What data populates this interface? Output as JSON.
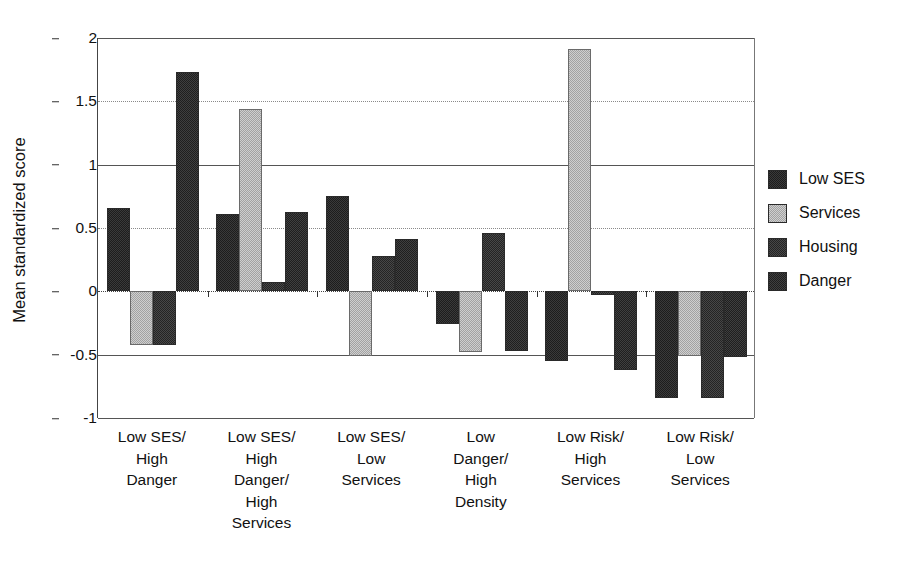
{
  "chart_data": {
    "type": "bar",
    "title": "",
    "xlabel": "",
    "ylabel": "Mean standardized score",
    "ylim": [
      -1,
      2
    ],
    "yticks": [
      "2",
      "1.5",
      "1",
      "0.5",
      "0",
      "-0.5",
      "-1"
    ],
    "ytick_values": [
      2,
      1.5,
      1,
      0.5,
      0,
      -0.5,
      -1
    ],
    "grid": true,
    "legend_position": "right",
    "categories": [
      "Low SES/ High Danger",
      "Low SES/ High Danger/ High Services",
      "Low SES/ Low Services",
      "Low Danger/ High Density",
      "Low Risk/ High Services",
      "Low Risk/ Low Services"
    ],
    "category_lines": [
      [
        "Low SES/",
        "High",
        "Danger"
      ],
      [
        "Low SES/",
        "High",
        "Danger/",
        "High",
        "Services"
      ],
      [
        "Low SES/",
        "Low",
        "Services"
      ],
      [
        "Low",
        "Danger/",
        "High",
        "Density"
      ],
      [
        "Low Risk/",
        "High",
        "Services"
      ],
      [
        "Low Risk/",
        "Low",
        "Services"
      ]
    ],
    "series": [
      {
        "name": "Low SES",
        "color": "#1d1d1d",
        "values": [
          0.66,
          0.61,
          0.75,
          -0.26,
          -0.55,
          -0.84
        ]
      },
      {
        "name": "Services",
        "color": "#cfcfcf",
        "values": [
          -0.42,
          1.44,
          -0.51,
          -0.48,
          1.91,
          -0.51
        ]
      },
      {
        "name": "Housing",
        "color": "#242424",
        "values": [
          -0.42,
          0.07,
          0.28,
          0.46,
          -0.03,
          -0.84
        ]
      },
      {
        "name": "Danger",
        "color": "#1f1f1f",
        "values": [
          1.73,
          0.63,
          0.41,
          -0.47,
          -0.62,
          -0.52
        ]
      }
    ]
  },
  "legend": {
    "items": [
      {
        "label": "Low SES",
        "swatch": "dark-swatch"
      },
      {
        "label": "Services",
        "swatch": "light-swatch"
      },
      {
        "label": "Housing",
        "swatch": "dark-swatch"
      },
      {
        "label": "Danger",
        "swatch": "dark-swatch"
      }
    ]
  },
  "axis": {
    "y_title": "Mean standardized score"
  }
}
